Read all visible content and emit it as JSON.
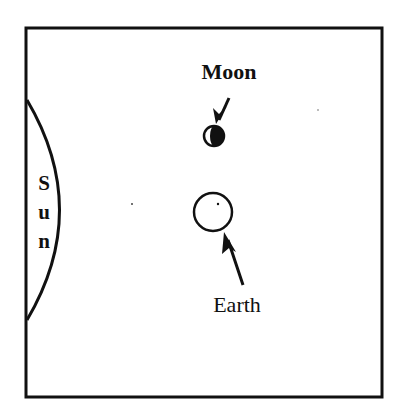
{
  "diagram": {
    "type": "astronomy-positions",
    "frame": {
      "x": 26,
      "y": 28,
      "width": 356,
      "height": 369
    },
    "colors": {
      "ink": "#111111",
      "background": "#ffffff"
    },
    "sun": {
      "label": "Sun",
      "letters": [
        "S",
        "u",
        "n"
      ]
    },
    "moon": {
      "label": "Moon",
      "phase_note": "left half lit, right half dark"
    },
    "earth": {
      "label": "Earth"
    }
  }
}
